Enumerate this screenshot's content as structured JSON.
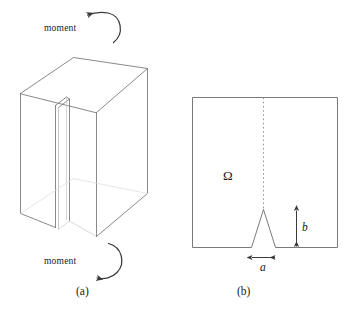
{
  "figure": {
    "type": "technical-diagram",
    "background_color": "#ffffff",
    "line_color": "#5a5a5a",
    "text_color": "#1a1a1a",
    "panel_a": {
      "caption": "(a)",
      "moment_top_label": "moment",
      "moment_bottom_label": "moment",
      "top_arrow_direction": "counterclockwise-left",
      "bottom_arrow_direction": "clockwise-down-left"
    },
    "panel_b": {
      "caption": "(b)",
      "domain_label": "Ω",
      "notch_width_label": "a",
      "notch_height_label": "b",
      "centerline_style": "dotted"
    }
  }
}
